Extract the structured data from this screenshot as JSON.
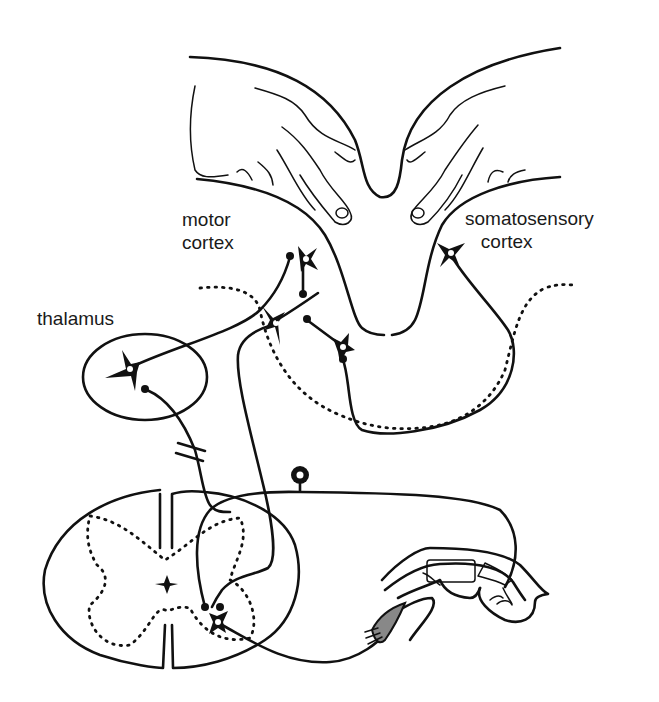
{
  "diagram": {
    "type": "neuroanatomy-schematic",
    "colors": {
      "ink": "#111111",
      "background": "#ffffff",
      "muscle": "#888888"
    },
    "labels": {
      "motor_cortex": "motor\ncortex",
      "somatosensory_cortex": "somatosensory\n   cortex",
      "thalamus": "thalamus"
    },
    "structures": [
      {
        "id": "brain-hemispheres",
        "name": "cerebral cortex with pyramidal neurons"
      },
      {
        "id": "thalamus",
        "name": "thalamus (oval with neuron)"
      },
      {
        "id": "spinal-cord",
        "name": "spinal cord cross-section (gray matter butterfly)"
      },
      {
        "id": "dorsal-root-ganglion",
        "name": "sensory neuron cell body"
      },
      {
        "id": "finger",
        "name": "finger with bones and flexor muscle"
      }
    ]
  }
}
